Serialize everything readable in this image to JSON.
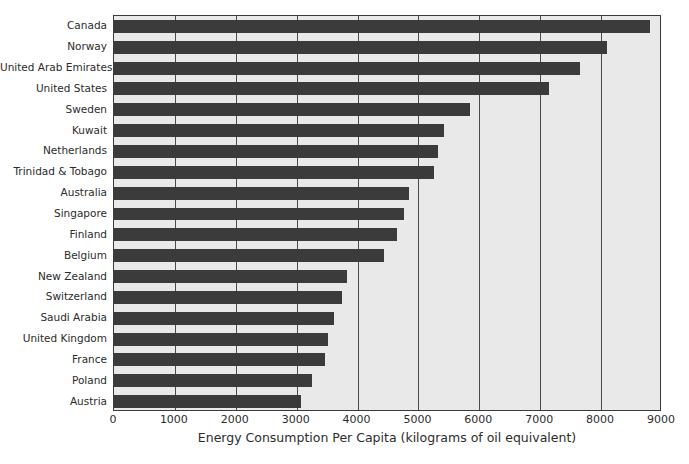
{
  "chart_data": {
    "type": "bar",
    "orientation": "horizontal",
    "title": "",
    "xlabel": "Energy Consumption Per Capita (kilograms of oil equivalent)",
    "ylabel": "",
    "xlim": [
      0,
      9000
    ],
    "xticks": [
      0,
      1000,
      2000,
      3000,
      4000,
      5000,
      6000,
      7000,
      8000,
      9000
    ],
    "xtick_labels": [
      "0",
      "1000",
      "2000",
      "3000",
      "4000",
      "5000",
      "6000",
      "7000",
      "8000",
      "9000"
    ],
    "grid": "vertical",
    "legend": "none",
    "bar_color": "#3b3b3b",
    "plot_background": "#e9e9e9",
    "categories": [
      "Canada",
      "Norway",
      "United Arab Emirates",
      "United States",
      "Sweden",
      "Kuwait",
      "Netherlands",
      "Trinidad & Tobago",
      "Australia",
      "Singapore",
      "Finland",
      "Belgium",
      "New Zealand",
      "Switzerland",
      "Saudi Arabia",
      "United Kingdom",
      "France",
      "Poland",
      "Austria"
    ],
    "values": [
      8800,
      8100,
      7650,
      7150,
      5850,
      5420,
      5320,
      5250,
      4850,
      4760,
      4650,
      4430,
      3830,
      3740,
      3620,
      3520,
      3470,
      3250,
      3070
    ]
  }
}
